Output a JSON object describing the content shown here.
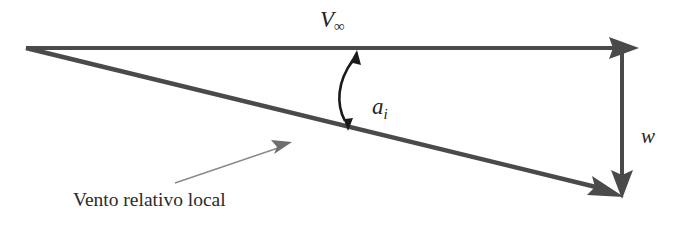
{
  "diagram": {
    "background_color": "#ffffff",
    "vector_color": "#4a4a4a",
    "arc_color": "#1a1a1a",
    "pointer_color": "#808080",
    "text_color": "#262626",
    "labels": {
      "freestream": "V",
      "freestream_subscript": "∞",
      "induced_angle": "a",
      "induced_angle_subscript": "i",
      "induced_velocity": "w",
      "relative_wind": "Vento relativo local"
    },
    "vectors": [
      {
        "name": "freestream-velocity",
        "label": "V∞",
        "from": [
          26,
          48
        ],
        "to": [
          637,
          48
        ],
        "orientation": "horizontal"
      },
      {
        "name": "local-relative-wind",
        "label": "Vento relativo local",
        "from": [
          26,
          48
        ],
        "to": [
          622,
          196
        ],
        "orientation": "diagonal-down-right"
      },
      {
        "name": "induced-velocity",
        "label": "w",
        "from": [
          622,
          50
        ],
        "to": [
          622,
          196
        ],
        "orientation": "vertical-down"
      }
    ],
    "angle_arc": {
      "name": "induced-angle-arc",
      "label": "a_i",
      "from": [
        356,
        52
      ],
      "to": [
        347,
        128
      ],
      "double_headed": true
    },
    "pointer": {
      "name": "relative-wind-pointer",
      "from": [
        175,
        183
      ],
      "to": [
        291,
        143
      ]
    }
  }
}
